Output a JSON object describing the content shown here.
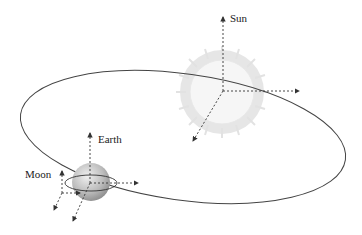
{
  "diagram": {
    "type": "astronomical-frames",
    "labels": {
      "sun": "Sun",
      "earth": "Earth",
      "moon": "Moon"
    },
    "colors": {
      "orbit": "#444444",
      "axis": "#333333",
      "sun_fill": "#f4f4f4",
      "sun_rays": "#e4e4e4",
      "earth_fill": "#bdbdbd",
      "text": "#222222"
    }
  }
}
